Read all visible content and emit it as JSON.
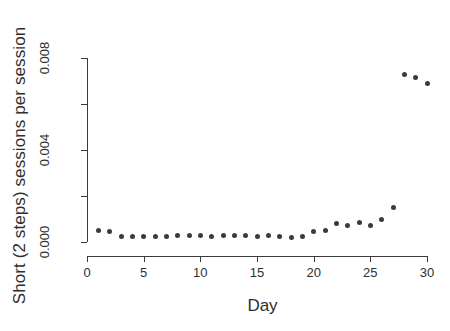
{
  "chart_data": {
    "type": "scatter",
    "title": "",
    "xlabel": "Day",
    "ylabel": "Short (2 steps) sessions per session",
    "xlim": [
      0,
      30
    ],
    "ylim": [
      0.0,
      0.008
    ],
    "grid": false,
    "legend": null,
    "marker": {
      "shape": "filled-circle",
      "color": "#3b3b3b",
      "size_px": 5
    },
    "x_ticks": [
      {
        "value": 0,
        "label": "0",
        "major": true
      },
      {
        "value": 5,
        "label": "5",
        "major": true
      },
      {
        "value": 10,
        "label": "10",
        "major": true
      },
      {
        "value": 15,
        "label": "15",
        "major": true
      },
      {
        "value": 20,
        "label": "20",
        "major": true
      },
      {
        "value": 25,
        "label": "25",
        "major": true
      },
      {
        "value": 30,
        "label": "30",
        "major": true
      }
    ],
    "y_ticks": [
      {
        "value": 0.0,
        "label": "0.000",
        "major": true
      },
      {
        "value": 0.002,
        "label": "",
        "major": false
      },
      {
        "value": 0.004,
        "label": "0.004",
        "major": true
      },
      {
        "value": 0.006,
        "label": "",
        "major": false
      },
      {
        "value": 0.008,
        "label": "0.008",
        "major": true
      }
    ],
    "x": [
      1,
      2,
      3,
      4,
      5,
      6,
      7,
      8,
      9,
      10,
      11,
      12,
      13,
      14,
      15,
      16,
      17,
      18,
      19,
      20,
      21,
      22,
      23,
      24,
      25,
      26,
      27,
      28,
      29,
      30
    ],
    "values": [
      0.00052,
      0.00044,
      0.00022,
      0.00024,
      0.00026,
      0.00026,
      0.00022,
      0.00028,
      0.00028,
      0.00028,
      0.00024,
      0.0003,
      0.00028,
      0.0003,
      0.00022,
      0.0003,
      0.00026,
      0.0002,
      0.00024,
      0.00044,
      0.0005,
      0.0008,
      0.0007,
      0.00086,
      0.00072,
      0.00098,
      0.0015,
      0.0073,
      0.00715,
      0.0069
    ]
  },
  "figure": {
    "background_color": "#ffffff",
    "axis_color": "#3a3a3a"
  }
}
